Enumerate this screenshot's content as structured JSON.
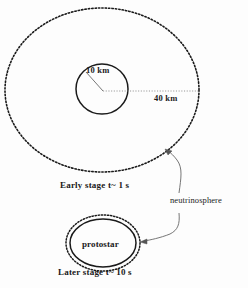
{
  "figure": {
    "background_color": "#fdfdfd",
    "ink_color": "#1a1a1a"
  },
  "early_stage": {
    "neutrinosphere_radius_label": "40 km",
    "core_radius_label": "10 km",
    "caption": "Early stage  t~ 1 s",
    "neutrinosphere": {
      "center_x": 102,
      "center_y": 90,
      "radius_x": 97,
      "radius_y": 82,
      "stroke_style": "dotted"
    },
    "core": {
      "center_x": 102,
      "center_y": 89,
      "radius_x": 26,
      "radius_y": 25,
      "stroke_style": "solid"
    }
  },
  "later_stage": {
    "core_label": "protostar",
    "caption": "Later stage  t~ 10 s",
    "neutrinosphere": {
      "center_x": 103,
      "center_y": 243,
      "radius_x": 37,
      "radius_y": 28,
      "stroke_style": "dotted"
    },
    "core": {
      "center_x": 103,
      "center_y": 243,
      "radius_x": 33,
      "radius_y": 24,
      "stroke_style": "solid"
    }
  },
  "callout": {
    "label": "neutrinosphere"
  }
}
